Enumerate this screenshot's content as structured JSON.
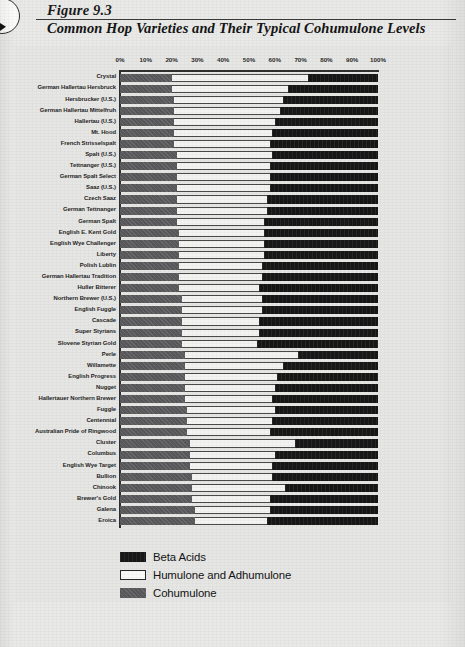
{
  "figure": {
    "number": "Figure 9.3",
    "title": "Common Hop Varieties and Their Typical Cohumulone Levels"
  },
  "legend": {
    "items": [
      {
        "label": "Beta Acids",
        "color": "#171717",
        "swatch": "beta-acids-swatch"
      },
      {
        "label": "Humulone and Adhumulone",
        "color": "#fbfbf9",
        "swatch": "humulone-swatch"
      },
      {
        "label": "Cohumulone",
        "color": "#58585a",
        "swatch": "cohumulone-swatch"
      }
    ]
  },
  "chart_data": {
    "type": "bar",
    "orientation": "horizontal",
    "stacked": true,
    "normalized_percent": true,
    "title": "Common Hop Varieties and Their Typical Cohumulone Levels",
    "xlabel": "",
    "ylabel": "",
    "xlim": [
      0,
      100
    ],
    "xticks": [
      0,
      10,
      20,
      30,
      40,
      50,
      60,
      70,
      80,
      90,
      100
    ],
    "xtick_labels": [
      "0%",
      "10%",
      "20%",
      "30%",
      "40%",
      "50%",
      "60%",
      "70%",
      "80%",
      "90%",
      "100%"
    ],
    "axis_position": "top",
    "grid": false,
    "legend_position": "bottom-left",
    "series": [
      {
        "name": "Cohumulone",
        "color": "#58585a",
        "values": [
          20,
          20,
          21,
          21,
          21,
          21,
          21,
          22,
          22,
          22,
          22,
          22,
          22,
          22,
          23,
          23,
          23,
          23,
          23,
          23,
          24,
          24,
          24,
          24,
          24,
          25,
          25,
          25,
          25,
          25,
          26,
          26,
          26,
          27,
          27,
          27,
          28,
          28,
          28,
          29,
          29
        ]
      },
      {
        "name": "Humulone and Adhumulone",
        "color": "#fbfbf9",
        "values": [
          53,
          45,
          42,
          41,
          39,
          38,
          37,
          37,
          36,
          36,
          36,
          35,
          35,
          34,
          33,
          33,
          33,
          32,
          32,
          31,
          31,
          31,
          30,
          30,
          29,
          44,
          38,
          36,
          35,
          34,
          34,
          33,
          32,
          41,
          33,
          32,
          31,
          36,
          30,
          29,
          28
        ]
      },
      {
        "name": "Beta Acids",
        "color": "#171717",
        "values": [
          27,
          35,
          37,
          38,
          40,
          41,
          42,
          41,
          42,
          42,
          42,
          43,
          43,
          44,
          44,
          44,
          44,
          45,
          45,
          46,
          45,
          45,
          46,
          46,
          47,
          31,
          37,
          39,
          40,
          41,
          40,
          41,
          42,
          32,
          40,
          41,
          41,
          36,
          42,
          42,
          43
        ]
      }
    ],
    "categories": [
      "Crystal",
      "German Hallertau Hersbruck",
      "Hersbrucker (U.S.)",
      "German Hallertau Mittelfruh",
      "Hallertau (U.S.)",
      "Mt. Hood",
      "French Strisselspalt",
      "Spalt (U.S.)",
      "Tettnanger (U.S.)",
      "German Spalt Select",
      "Saaz (U.S.)",
      "Czech Saaz",
      "German Tettnanger",
      "German Spalt",
      "English E. Kent Gold",
      "English Wye Challenger",
      "Liberty",
      "Polish Lublin",
      "German Hallertau Tradition",
      "Huller Bitterer",
      "Northern Brewer (U.S.)",
      "English Fuggle",
      "Cascade",
      "Super Styrians",
      "Slovene Styrian Gold",
      "Perle",
      "Willamette",
      "English Progress",
      "Nugget",
      "Hallertauer Northern Brewer",
      "Fuggle",
      "Centennial",
      "Australian Pride of Ringwood",
      "Cluster",
      "Columbus",
      "English Wye Target",
      "Bullion",
      "Chinook",
      "Brewer's Gold",
      "Galena",
      "Eroica"
    ]
  }
}
